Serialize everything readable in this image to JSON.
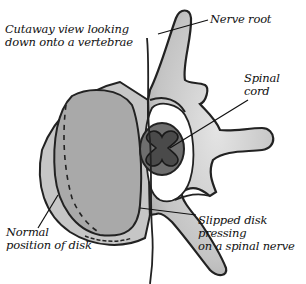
{
  "diagram": {
    "title": "Cutaway view looking down onto a vertebrae",
    "labels": {
      "title_line1": "Cutaway view looking",
      "title_line2": "down onto a vertebrae",
      "nerve_root": "Nerve root",
      "spinal_cord_line1": "Spinal",
      "spinal_cord_line2": "cord",
      "normal_disk_line1": "Normal",
      "normal_disk_line2": "position of disk",
      "slipped_disk_line1": "Slipped disk",
      "slipped_disk_line2": "pressing",
      "slipped_disk_line3": "on a spinal nerve"
    },
    "colors": {
      "outline": "#222222",
      "bone_light": "#d8d8d8",
      "bone_mid": "#b4b4b4",
      "disk": "#a8a8a8",
      "cord_outer": "#6e6e6e",
      "cord_inner": "#4a4a4a"
    }
  }
}
